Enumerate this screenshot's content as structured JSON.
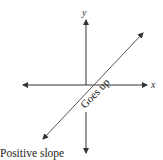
{
  "diagram": {
    "title": "Positive slope",
    "axes": {
      "x_label": "x",
      "y_label": "y"
    },
    "line_annotation": "Goes up",
    "colors": {
      "axis": "#333333",
      "line": "#555555",
      "text": "#222222"
    }
  }
}
